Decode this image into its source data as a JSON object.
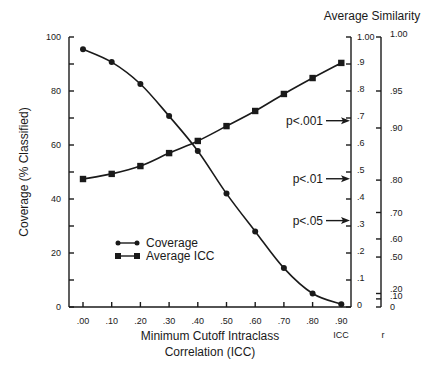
{
  "chart_data": {
    "type": "line",
    "title": "",
    "xlabel": "Minimum Cutoff Intraclass Correlation (ICC)",
    "xlabel_lines": [
      "Minimum Cutoff Intraclass",
      "Correlation (ICC)"
    ],
    "ylabel": "Coverage (% Classified)",
    "right_title": "Average Similarity",
    "x": [
      0.0,
      0.1,
      0.2,
      0.3,
      0.4,
      0.5,
      0.6,
      0.7,
      0.8,
      0.9
    ],
    "x_tick_labels": [
      ".00",
      ".10",
      ".20",
      ".30",
      ".40",
      ".50",
      ".60",
      ".70",
      ".80",
      ".90"
    ],
    "ylim": [
      0,
      100
    ],
    "y_tick_labels": [
      "0",
      "20",
      "40",
      "60",
      "80",
      "100"
    ],
    "y_ticks": [
      0,
      10,
      20,
      30,
      40,
      50,
      60,
      70,
      80,
      90,
      100
    ],
    "series": [
      {
        "name": "Coverage",
        "marker": "circle",
        "axis": "left",
        "values": [
          95.5,
          90.7,
          82.6,
          70.7,
          57.8,
          42.0,
          28.0,
          14.4,
          5.0,
          1.0
        ]
      },
      {
        "name": "Average ICC",
        "marker": "square",
        "axis": "left",
        "values": [
          47.4,
          49.3,
          52.2,
          57.0,
          61.5,
          67.0,
          72.6,
          78.9,
          84.8,
          90.4
        ]
      }
    ],
    "right_axes": [
      {
        "name": "ICC",
        "label": "ICC",
        "range": [
          0,
          1
        ],
        "ticks": [
          {
            "label": "0",
            "value": 0
          },
          {
            "label": ".1",
            "value": 0.1
          },
          {
            "label": ".2",
            "value": 0.2
          },
          {
            "label": ".3",
            "value": 0.3
          },
          {
            "label": ".4",
            "value": 0.4
          },
          {
            "label": ".5",
            "value": 0.5
          },
          {
            "label": ".6",
            "value": 0.6
          },
          {
            "label": ".7",
            "value": 0.7
          },
          {
            "label": ".8",
            "value": 0.8
          },
          {
            "label": ".9",
            "value": 0.9
          },
          {
            "label": "1.00",
            "value": 1.0
          }
        ]
      },
      {
        "name": "r",
        "label": "r",
        "scale": "nonlinear",
        "ticks": [
          {
            "label": "0",
            "pos": 0
          },
          {
            "label": ".10",
            "pos": 3
          },
          {
            "label": ".20",
            "pos": 5
          },
          {
            "label": ".50",
            "pos": 18.5
          },
          {
            "label": ".60",
            "pos": 25.2
          },
          {
            "label": ".70",
            "pos": 35
          },
          {
            "label": ".80",
            "pos": 47
          },
          {
            "label": ".90",
            "pos": 66.3
          },
          {
            "label": ".95",
            "pos": 80
          },
          {
            "label": "1.00",
            "pos": 100
          }
        ]
      }
    ],
    "annotations": [
      {
        "text": "p<.001",
        "icc_value": 0.69
      },
      {
        "text": "p<.01",
        "icc_value": 0.475
      },
      {
        "text": "p<.05",
        "icc_value": 0.32
      }
    ],
    "legend": {
      "position": "lower-left inside",
      "entries": [
        "Coverage",
        "Average ICC"
      ]
    },
    "grid": false
  }
}
